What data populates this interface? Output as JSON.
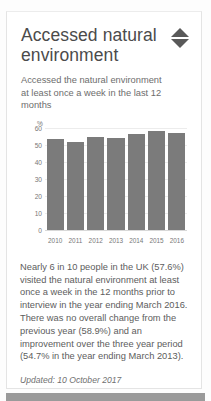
{
  "card": {
    "title": "Accessed natural environment",
    "subtitle": "Accessed the natural environment at least once a week in the last 12 months",
    "sort_icon": "sort-updown-icon",
    "body": "Nearly 6 in 10 people in the UK (57.6%) visited the natural environment at least once a week in the 12 months prior to interview in the year ending March 2016. There was no overall change from the previous year (58.9%) and an improvement over the three year period (54.7% in the year ending March 2013).",
    "updated": "Updated: 10 October 2017"
  },
  "colors": {
    "bar": "#7b7b7b",
    "title_text": "#4b4b4b",
    "body_text": "#5d5d5d",
    "gridline": "#ececec",
    "card_border": "#e4e4e4",
    "bottom_bar": "#9a9a9a"
  },
  "chart_data": {
    "type": "bar",
    "title": "",
    "xlabel": "",
    "ylabel": "%",
    "categories": [
      "2010",
      "2011",
      "2012",
      "2013",
      "2014",
      "2015",
      "2016"
    ],
    "values": [
      54.0,
      52.0,
      55.0,
      54.7,
      57.0,
      58.9,
      57.6
    ],
    "ylim": [
      0,
      60
    ],
    "yticks": [
      0,
      10,
      20,
      30,
      40,
      50,
      60
    ],
    "grid": true,
    "legend": "none"
  }
}
